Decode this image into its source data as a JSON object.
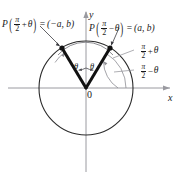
{
  "figure": {
    "name": "unit-circle-cofunction-identity-diagram",
    "background": "#ffffff",
    "ink": "#1a1a1a",
    "axis_color": "#9a9aa0",
    "circle_color": "#2b2b2b",
    "ray_color": "#111111"
  },
  "axes": {
    "x_label": "x",
    "y_label": "y",
    "origin_label": "0"
  },
  "labels": {
    "left_point": {
      "fn": "P",
      "open": "(",
      "num": "π",
      "den": "2",
      "op": "+",
      "theta": "θ",
      "close": ")",
      "eq": "=",
      "coord": "(−a, b)"
    },
    "right_point": {
      "fn": "P",
      "open": "(",
      "num": "π",
      "den": "2",
      "op": "−",
      "theta": "θ",
      "close": ")",
      "eq": "=",
      "coord": "(a, b)"
    },
    "arc_upper": {
      "num": "π",
      "den": "2",
      "op": "+",
      "theta": "θ"
    },
    "arc_lower": {
      "num": "π",
      "den": "2",
      "op": "−",
      "theta": "θ"
    },
    "theta_left": "θ",
    "theta_right": "θ"
  },
  "geometry": {
    "center_x": 86,
    "center_y": 88,
    "radius": 47,
    "left_point_x": 62,
    "left_point_y": 48,
    "right_point_x": 110,
    "right_point_y": 48
  }
}
